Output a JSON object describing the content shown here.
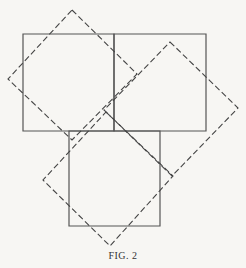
{
  "figure": {
    "caption": "Fig. 2",
    "caption_display": "FIG. 2",
    "colors": {
      "background": "#f7f6f3",
      "stroke": "#555555"
    },
    "solid_squares": [
      {
        "name": "top-left-square",
        "points": "23,34 114,34 114,131 23,131"
      },
      {
        "name": "top-right-square",
        "points": "114,34 206,34 206,131 114,131"
      },
      {
        "name": "bottom-square",
        "points": "69,131 160,131 160,226 69,226"
      }
    ],
    "dashed_squares": [
      {
        "name": "dashed-square-left",
        "points": "72,10 137,74 72,140 8,79"
      },
      {
        "name": "dashed-square-right",
        "points": "170,42 238,108 172,176 104,110"
      },
      {
        "name": "dashed-square-bottom",
        "points": "106,112 173,176 110,246 43,180"
      }
    ]
  }
}
